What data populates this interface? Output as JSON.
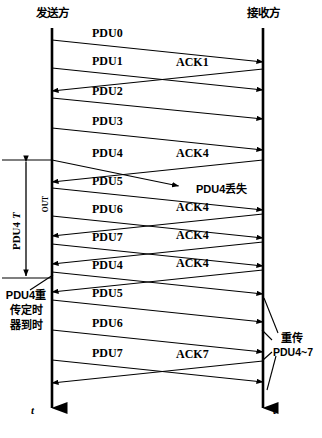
{
  "header": {
    "sender_label": "发送方",
    "receiver_label": "接收方"
  },
  "timelines": {
    "sender_x": 52,
    "receiver_x": 263,
    "top_y": 28,
    "bottom_y": 424,
    "axis_label": "t"
  },
  "annotations": {
    "timeout_label_main": "PDU4",
    "timeout_label_sub": "OUT",
    "timeout_label_t": "T",
    "retrans_timer": [
      "PDU4重",
      "传定时",
      "器到时"
    ],
    "pdu4_lost": "PDU4丢失",
    "retransmit_title": "重传",
    "retransmit_range": "PDU4~7"
  },
  "messages": [
    {
      "id": "pdu0",
      "label": "PDU0",
      "dir": "to-receiver",
      "y_start": 40,
      "y_end": 62,
      "lost": false
    },
    {
      "id": "pdu1",
      "label": "PDU1",
      "dir": "to-receiver",
      "y_start": 68,
      "y_end": 90,
      "lost": false
    },
    {
      "id": "ack1",
      "label": "ACK1",
      "dir": "to-sender",
      "y_start": 69,
      "y_end": 91,
      "lost": false
    },
    {
      "id": "pdu2",
      "label": "PDU2",
      "dir": "to-receiver",
      "y_start": 98,
      "y_end": 119,
      "lost": false
    },
    {
      "id": "pdu3",
      "label": "PDU3",
      "dir": "to-receiver",
      "y_start": 128,
      "y_end": 150,
      "lost": false
    },
    {
      "id": "pdu4a",
      "label": "PDU4",
      "dir": "to-receiver",
      "y_start": 160,
      "y_end": 186,
      "lost": true
    },
    {
      "id": "ack4a",
      "label": "ACK4",
      "dir": "to-sender",
      "y_start": 160,
      "y_end": 182,
      "lost": false
    },
    {
      "id": "pdu5a",
      "label": "PDU5",
      "dir": "to-receiver",
      "y_start": 188,
      "y_end": 210,
      "lost": false
    },
    {
      "id": "pdu6a",
      "label": "PDU6",
      "dir": "to-receiver",
      "y_start": 216,
      "y_end": 238,
      "lost": false
    },
    {
      "id": "ack4b",
      "label": "ACK4",
      "dir": "to-sender",
      "y_start": 214,
      "y_end": 236,
      "lost": false
    },
    {
      "id": "pdu7a",
      "label": "PDU7",
      "dir": "to-receiver",
      "y_start": 244,
      "y_end": 266,
      "lost": false
    },
    {
      "id": "ack4c",
      "label": "ACK4",
      "dir": "to-sender",
      "y_start": 242,
      "y_end": 264,
      "lost": false
    },
    {
      "id": "pdu4b",
      "label": "PDU4",
      "dir": "to-receiver",
      "y_start": 272,
      "y_end": 294,
      "lost": false
    },
    {
      "id": "ack4d",
      "label": "ACK4",
      "dir": "to-sender",
      "y_start": 270,
      "y_end": 292,
      "lost": false
    },
    {
      "id": "pdu5b",
      "label": "PDU5",
      "dir": "to-receiver",
      "y_start": 300,
      "y_end": 322,
      "lost": false
    },
    {
      "id": "pdu6b",
      "label": "PDU6",
      "dir": "to-receiver",
      "y_start": 330,
      "y_end": 352,
      "lost": false
    },
    {
      "id": "pdu7b",
      "label": "PDU7",
      "dir": "to-receiver",
      "y_start": 360,
      "y_end": 382,
      "lost": false
    },
    {
      "id": "ack7",
      "label": "ACK7",
      "dir": "to-sender",
      "y_start": 361,
      "y_end": 383,
      "lost": false
    }
  ],
  "timeout_bracket": {
    "x": 26,
    "y_top": 160,
    "y_bottom": 278
  },
  "colors": {
    "ink": "#000000",
    "background": "#ffffff"
  }
}
